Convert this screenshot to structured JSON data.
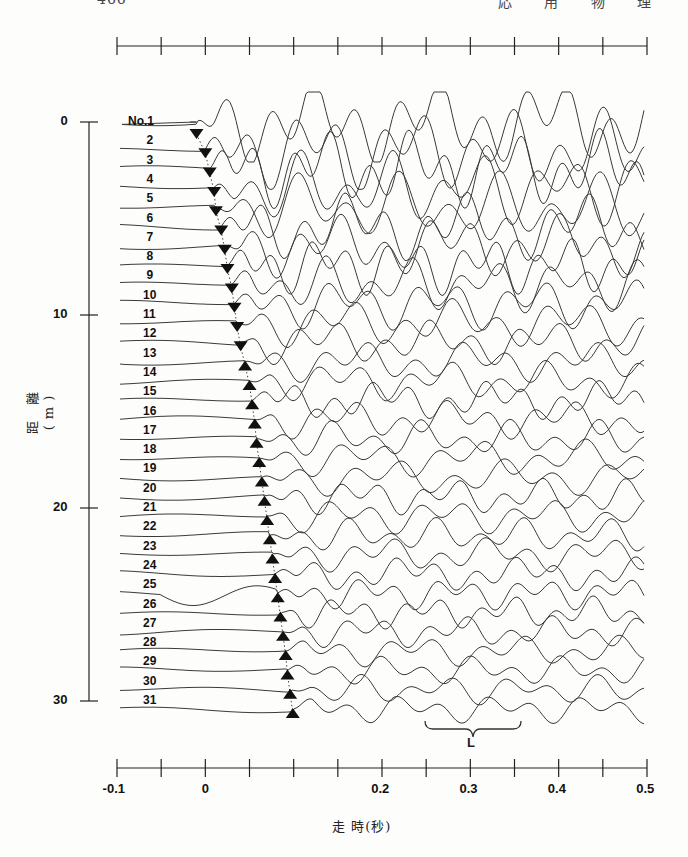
{
  "header": {
    "page_number": "466",
    "running_title": "応 用 物 理"
  },
  "chart_data": {
    "type": "line",
    "title": "",
    "subtitle": "Seismic record section (stacked waveforms) with first-arrival picks",
    "xlabel": "走 時(秒)",
    "ylabel": "距 離 (m)",
    "xlim": [
      -0.1,
      0.5
    ],
    "ylim": [
      0,
      30
    ],
    "x_ticks": [
      "-0.1",
      "0",
      "0.2",
      "0.3",
      "0.4",
      "0.5"
    ],
    "x_tick_values": [
      -0.1,
      0,
      0.2,
      0.3,
      0.4,
      0.5
    ],
    "x_minor_ticks": [
      -0.05,
      0.05,
      0.15,
      0.25,
      0.35,
      0.45
    ],
    "y_ticks": [
      "0",
      "10",
      "20",
      "30"
    ],
    "y_tick_values": [
      0,
      10,
      20,
      30
    ],
    "grid": false,
    "legend": null,
    "trace_labels": [
      "No.1",
      "2",
      "3",
      "4",
      "5",
      "6",
      "7",
      "8",
      "9",
      "10",
      "11",
      "12",
      "13",
      "14",
      "15",
      "16",
      "17",
      "18",
      "19",
      "20",
      "21",
      "22",
      "23",
      "24",
      "25",
      "26",
      "27",
      "28",
      "29",
      "30",
      "31"
    ],
    "series": [
      {
        "name": "first-arrival picks (traces 1-12, inverted triangles)",
        "marker": "triangle-down",
        "x": [
          -0.01,
          0.0,
          0.005,
          0.01,
          0.012,
          0.018,
          0.022,
          0.025,
          0.03,
          0.033,
          0.036,
          0.04
        ],
        "y": [
          0,
          1,
          2,
          3,
          4,
          5,
          6,
          7,
          8,
          9,
          10,
          11
        ]
      },
      {
        "name": "first-arrival picks (traces 13-31, triangles)",
        "marker": "triangle-up",
        "x": [
          0.045,
          0.05,
          0.053,
          0.056,
          0.058,
          0.061,
          0.064,
          0.067,
          0.07,
          0.073,
          0.076,
          0.079,
          0.082,
          0.085,
          0.088,
          0.091,
          0.093,
          0.096,
          0.099
        ],
        "y": [
          12,
          13,
          14,
          15,
          16,
          17,
          18,
          19,
          20,
          21,
          22,
          23,
          24,
          25,
          26,
          27,
          28,
          29,
          30
        ]
      }
    ],
    "annotations": [
      {
        "text": "L",
        "type": "brace",
        "x_range": [
          0.29,
          0.38
        ],
        "y": 31.5
      }
    ]
  },
  "colors": {
    "ink": "#1a1a1a",
    "trace": "#3a3a3a",
    "background": "#fdfdfc"
  }
}
